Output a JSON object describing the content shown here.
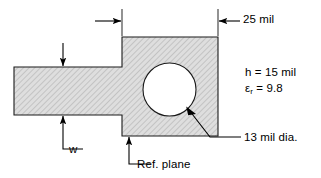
{
  "figure": {
    "kind": "engineering-drawing",
    "fill_color": "#d9d9d9",
    "line_color": "#000000",
    "background_color": "#ffffff"
  },
  "annotations": {
    "width_25mil": "25 mil",
    "substrate_height": "h  = 15 mil",
    "dielectric_constant_symbol": "ε",
    "dielectric_constant_subscript": "r",
    "dielectric_constant_value": " = 9.8",
    "hole_diameter": "13 mil dia.",
    "trace_width": "w",
    "reference_plane": "Ref. plane"
  },
  "geometry": {
    "pad_rect": {
      "x": 122,
      "y": 37,
      "width": 96,
      "height": 99
    },
    "trace_rect": {
      "x": 14,
      "y": 67,
      "width": 108,
      "height": 48
    },
    "hole_circle": {
      "cx": 169.5,
      "cy": 89.5,
      "r": 26.5
    }
  }
}
